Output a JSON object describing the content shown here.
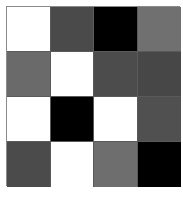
{
  "grid": {
    "rows": 4,
    "cols": 4,
    "cells": [
      [
        "#ffffff",
        "#4a4a4a",
        "#000000",
        "#707070"
      ],
      [
        "#6a6a6a",
        "#ffffff",
        "#4c4c4c",
        "#474747"
      ],
      [
        "#ffffff",
        "#000000",
        "#ffffff",
        "#505050"
      ],
      [
        "#4b4b4b",
        "#ffffff",
        "#6e6e6e",
        "#000000"
      ]
    ]
  }
}
